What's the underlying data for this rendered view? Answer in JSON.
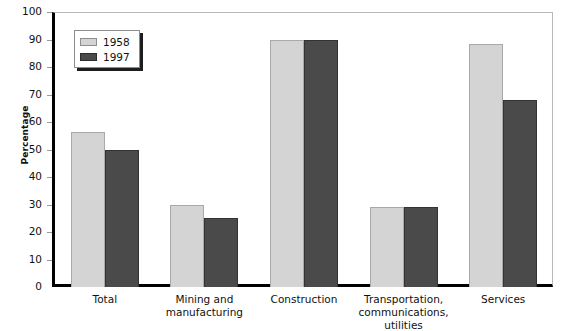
{
  "chart_data": {
    "type": "bar",
    "title": "",
    "subtitle": "",
    "xlabel": "",
    "ylabel": "Percentage",
    "ylim": [
      0,
      100
    ],
    "ytick_step": 10,
    "yticks": [
      0,
      10,
      20,
      30,
      40,
      50,
      60,
      70,
      80,
      90,
      100
    ],
    "grid": false,
    "legend_position": "top-left",
    "categories": [
      "Total",
      "Mining and manufacturing",
      "Construction",
      "Transportation, communications, utilities",
      "Services"
    ],
    "category_label_lines": [
      [
        "Total"
      ],
      [
        "Mining and",
        "manufacturing"
      ],
      [
        "Construction"
      ],
      [
        "Transportation,",
        "communications,",
        "utilities"
      ],
      [
        "Services"
      ]
    ],
    "series": [
      {
        "name": "1958",
        "color": "#d4d4d4",
        "values": [
          56.5,
          30,
          90,
          29,
          88.5
        ]
      },
      {
        "name": "1997",
        "color": "#4a4a4a",
        "values": [
          50,
          25,
          90,
          29,
          68
        ]
      }
    ]
  },
  "legend": {
    "entries": [
      {
        "label": "1958"
      },
      {
        "label": "1997"
      }
    ]
  },
  "colors": {
    "series_1958": "#d4d4d4",
    "series_1997": "#4a4a4a",
    "axis": "#000000",
    "frame": "#b8b8b8",
    "tick": "#9a9a9a",
    "text": "#111111",
    "background": "#ffffff"
  }
}
